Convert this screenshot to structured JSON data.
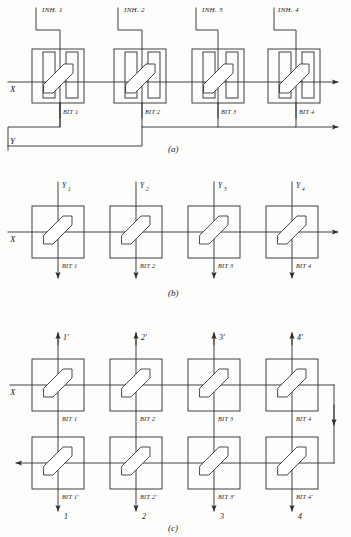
{
  "figure": {
    "background_color": "#fdfdfb",
    "line_color": "#2a2a2a",
    "panels": [
      {
        "id": "a",
        "caption": "(a)",
        "description": "Four-core row with inhibit windings, X drive line and Y return line",
        "axis_labels": {
          "x": "X",
          "y": "Y"
        },
        "inhibit_labels": [
          "INH. 1",
          "INH. 2",
          "INH. 3",
          "INH. 4"
        ],
        "bit_labels": [
          "BIT 1",
          "BIT 2",
          "BIT 3",
          "BIT 4"
        ],
        "core_count": 4,
        "output_arrows": 2
      },
      {
        "id": "b",
        "caption": "(b)",
        "description": "Four-core row with separate Y drive lines per bit",
        "axis_labels": {
          "x": "X"
        },
        "y_labels": [
          "Y",
          "Y",
          "Y",
          "Y"
        ],
        "y_subscripts": [
          "1",
          "2",
          "3",
          "4"
        ],
        "bit_labels": [
          "BIT 1",
          "BIT 2",
          "BIT 3",
          "BIT 4"
        ],
        "core_count": 4,
        "output_arrows": 1
      },
      {
        "id": "c",
        "caption": "(c)",
        "description": "Two rows of four cores with X line folded from upper to lower row",
        "axis_labels": {
          "x": "X"
        },
        "top_labels": [
          "1'",
          "2'",
          "3'",
          "4'"
        ],
        "bottom_labels": [
          "1",
          "2",
          "3",
          "4"
        ],
        "bit_labels_top": [
          "BIT 1",
          "BIT 2",
          "BIT 3",
          "BIT 4"
        ],
        "bit_labels_bottom": [
          "BIT 1'",
          "BIT 2'",
          "BIT 3'",
          "BIT 4'"
        ],
        "core_count": 8,
        "output_arrows": 1
      }
    ]
  }
}
